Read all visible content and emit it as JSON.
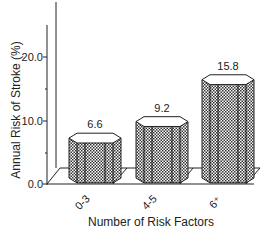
{
  "chart_data": {
    "type": "bar",
    "title": "",
    "xlabel": "Number of Risk Factors",
    "ylabel": "Annual Risk of Stroke (%)",
    "categories": [
      "0-3",
      "4-5",
      "6+"
    ],
    "category_display": [
      "0-3",
      "4-5",
      "6⁺"
    ],
    "values": [
      6.6,
      9.2,
      15.8
    ],
    "value_labels": [
      "6.6",
      "9.2",
      "15.8"
    ],
    "yticks": [
      0.0,
      10.0,
      20.0
    ],
    "ytick_labels": [
      "0.0",
      "10.0",
      "20.0"
    ],
    "ylim": [
      0,
      25
    ],
    "grid": false,
    "legend": null,
    "style": "3d-octagonal-cylinders-crosshatch"
  },
  "colors": {
    "ink": "#222222",
    "fill_dark": "#333333",
    "fill_light": "#ffffff"
  }
}
